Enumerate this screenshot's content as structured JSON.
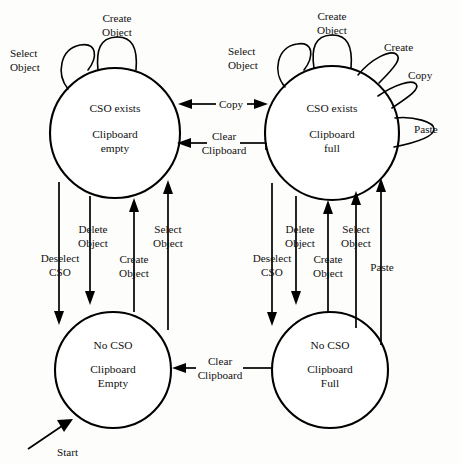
{
  "diagram": {
    "kind": "state-transition-diagram",
    "background_color": "#fdfdfc",
    "stroke_color": "#000000",
    "text_color": "#111111",
    "start_label": "Start",
    "states": [
      {
        "id": "cso-exists-clipboard-empty",
        "line1": "CSO exists",
        "line2": "Clipboard",
        "line3": "empty",
        "cx": 115,
        "cy": 133,
        "r": 65
      },
      {
        "id": "cso-exists-clipboard-full",
        "line1": "CSO exists",
        "line2": "Clipboard",
        "line3": "full",
        "cx": 332,
        "cy": 133,
        "r": 67
      },
      {
        "id": "no-cso-clipboard-empty",
        "line1": "No CSO",
        "line2": "Clipboard",
        "line3": "Empty",
        "cx": 113,
        "cy": 370,
        "r": 58
      },
      {
        "id": "no-cso-clipboard-full",
        "line1": "No CSO",
        "line2": "Clipboard",
        "line3": "Full",
        "cx": 330,
        "cy": 370,
        "r": 58
      }
    ],
    "self_loops": [
      {
        "id": "tl-create-object",
        "line1": "Create",
        "line2": "Object"
      },
      {
        "id": "tl-select-object",
        "line1": "Select",
        "line2": "Object"
      },
      {
        "id": "tr-create-object",
        "line1": "Create",
        "line2": "Object"
      },
      {
        "id": "tr-select-object",
        "line1": "Select",
        "line2": "Object"
      },
      {
        "id": "tr-create",
        "line1": "Create",
        "line2": ""
      },
      {
        "id": "tr-copy",
        "line1": "Copy",
        "line2": ""
      },
      {
        "id": "tr-paste",
        "line1": "Paste",
        "line2": ""
      }
    ],
    "transitions": [
      {
        "id": "copy-bidirectional",
        "line1": "Copy",
        "line2": "",
        "direction": "both"
      },
      {
        "id": "clear-clipboard-top",
        "line1": "Clear",
        "line2": "Clipboard",
        "direction": "left"
      },
      {
        "id": "clear-clipboard-bottom",
        "line1": "Clear",
        "line2": "Clipboard",
        "direction": "left"
      },
      {
        "id": "left-deselect-cso",
        "line1": "Deselect",
        "line2": "CSO",
        "direction": "down"
      },
      {
        "id": "left-delete-object",
        "line1": "Delete",
        "line2": "Object",
        "direction": "down"
      },
      {
        "id": "left-create-object",
        "line1": "Create",
        "line2": "Object",
        "direction": "up"
      },
      {
        "id": "left-select-object",
        "line1": "Select",
        "line2": "Object",
        "direction": "up"
      },
      {
        "id": "right-deselect-cso",
        "line1": "Deselect",
        "line2": "CSO",
        "direction": "down"
      },
      {
        "id": "right-delete-object",
        "line1": "Delete",
        "line2": "Object",
        "direction": "down"
      },
      {
        "id": "right-create-object",
        "line1": "Create",
        "line2": "Object",
        "direction": "up"
      },
      {
        "id": "right-select-object",
        "line1": "Select",
        "line2": "Object",
        "direction": "up"
      },
      {
        "id": "right-paste",
        "line1": "Paste",
        "line2": "",
        "direction": "up"
      }
    ]
  }
}
